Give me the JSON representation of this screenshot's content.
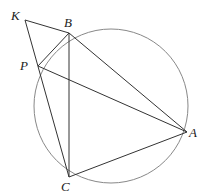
{
  "diagram": {
    "type": "geometry",
    "circle": {
      "cx": 111,
      "cy": 106,
      "r": 77,
      "color": "#888888"
    },
    "points": {
      "K": {
        "x": 25,
        "y": 20,
        "label": "K",
        "lx": 11,
        "ly": 20
      },
      "B": {
        "x": 69,
        "y": 33,
        "label": "B",
        "lx": 64,
        "ly": 27
      },
      "P": {
        "x": 38,
        "y": 66,
        "label": "P",
        "lx": 20,
        "ly": 70
      },
      "A": {
        "x": 187,
        "y": 132,
        "label": "A",
        "lx": 189,
        "ly": 137
      },
      "C": {
        "x": 69,
        "y": 177,
        "label": "C",
        "lx": 61,
        "ly": 191
      }
    },
    "segments": [
      [
        "K",
        "B"
      ],
      [
        "K",
        "C"
      ],
      [
        "B",
        "A"
      ],
      [
        "B",
        "C"
      ],
      [
        "B",
        "P"
      ],
      [
        "P",
        "A"
      ],
      [
        "C",
        "A"
      ]
    ],
    "line_color": "#333333"
  }
}
